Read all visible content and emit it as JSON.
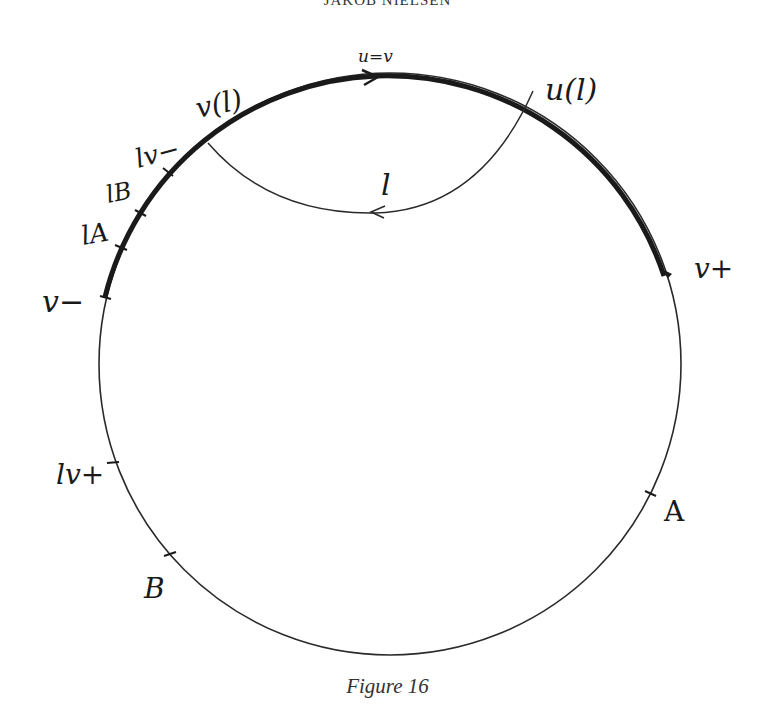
{
  "header": {
    "running_head": "JAKOB NIELSEN"
  },
  "figure": {
    "caption": "Figure 16",
    "circle": {
      "cx": 390,
      "cy": 364,
      "r": 291
    },
    "colors": {
      "ink": "#1a1a1a",
      "paper": "#ffffff"
    },
    "labels": {
      "u_eq_v": "u=v",
      "u_l": "u(l)",
      "v_l": "v(l)",
      "lv_minus": "lv−",
      "l_B": "lB",
      "l_A": "lA",
      "v_minus": "v−",
      "v_plus": "v+",
      "lv_plus": "lv+",
      "A": "A",
      "B": "B",
      "l": "l"
    }
  }
}
